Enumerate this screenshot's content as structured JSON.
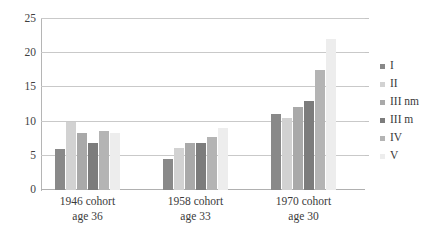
{
  "chart_data": {
    "type": "bar",
    "title": "",
    "subtitle": "",
    "xlabel": "",
    "ylabel": "",
    "ylim": [
      0,
      25
    ],
    "yticks": [
      0,
      5,
      10,
      15,
      20,
      25
    ],
    "grid": true,
    "legend_position": "right",
    "categories": [
      "1946 cohort\nage 36",
      "1958 cohort\nage 33",
      "1970 cohort\nage 30"
    ],
    "category_lines": [
      {
        "line1": "1946 cohort",
        "line2": "age 36"
      },
      {
        "line1": "1958 cohort",
        "line2": "age 33"
      },
      {
        "line1": "1970 cohort",
        "line2": "age 30"
      }
    ],
    "series": [
      {
        "name": "I",
        "color": "#898989",
        "values": [
          6.0,
          4.6,
          11.1
        ]
      },
      {
        "name": "II",
        "color": "#d2d2d2",
        "values": [
          9.9,
          6.2,
          10.6
        ]
      },
      {
        "name": "III nm",
        "color": "#a9a9a9",
        "values": [
          8.4,
          6.9,
          12.1
        ]
      },
      {
        "name": "III m",
        "color": "#7c7c7c",
        "values": [
          6.9,
          6.9,
          13.0
        ]
      },
      {
        "name": "IV",
        "color": "#b4b4b4",
        "values": [
          8.7,
          7.8,
          17.5
        ]
      },
      {
        "name": "V",
        "color": "#ededed",
        "values": [
          8.4,
          9.0,
          22.1
        ]
      }
    ]
  },
  "colors": {
    "grid": "#c9c9c9",
    "axis": "#b5b5b5",
    "text": "#3a3a3a",
    "background": "#ffffff"
  }
}
